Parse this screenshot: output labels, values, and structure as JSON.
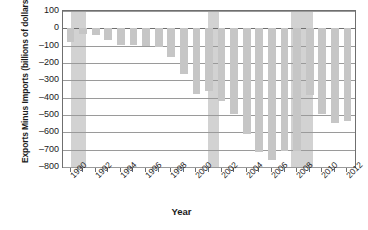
{
  "chart_data": {
    "type": "bar",
    "title": "",
    "xlabel": "Year",
    "ylabel": "Exports Minus Imports (billions of dollars)",
    "ylim": [
      -800,
      100
    ],
    "xlim": [
      1989.4,
      2012.6
    ],
    "grid": true,
    "legend": "none",
    "bar_color": "#c6c6c6",
    "recession_color": "#d2d2d2",
    "axis_color": "#6f6f6f",
    "gridline_color": "#9a9a9a",
    "yticks": [
      100,
      0,
      -100,
      -200,
      -300,
      -400,
      -500,
      -600,
      -700,
      -800
    ],
    "ytick_labels": [
      "100",
      "0",
      "–100",
      "–200",
      "–300",
      "–400",
      "–500",
      "–600",
      "–700",
      "–800"
    ],
    "xticks": [
      1990,
      1992,
      1994,
      1996,
      1998,
      2000,
      2002,
      2004,
      2006,
      2008,
      2010,
      2012
    ],
    "xtick_labels": [
      "1990",
      "1992",
      "1994",
      "1996",
      "1998",
      "2000",
      "2002",
      "2004",
      "2006",
      "2008",
      "2010",
      "2012"
    ],
    "categories": [
      1990,
      1991,
      1992,
      1993,
      1994,
      1995,
      1996,
      1997,
      1998,
      1999,
      2000,
      2001,
      2002,
      2003,
      2004,
      2005,
      2006,
      2007,
      2008,
      2009,
      2010,
      2011,
      2012
    ],
    "values": [
      -80,
      -31,
      -39,
      -70,
      -98,
      -96,
      -104,
      -108,
      -166,
      -263,
      -377,
      -362,
      -421,
      -494,
      -610,
      -714,
      -762,
      -705,
      -709,
      -384,
      -494,
      -549,
      -535
    ],
    "annotations": [
      {
        "label": "recession",
        "start": 1990.0,
        "end": 1991.2
      },
      {
        "label": "recession",
        "start": 2000.9,
        "end": 2001.8
      },
      {
        "label": "recession",
        "start": 2007.5,
        "end": 2009.3
      }
    ]
  }
}
